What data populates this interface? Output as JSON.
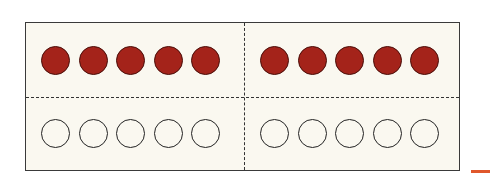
{
  "figure": {
    "frames": [
      {
        "top_row": [
          "filled",
          "filled",
          "filled",
          "filled",
          "filled"
        ],
        "bottom_row": [
          "empty",
          "empty",
          "empty",
          "empty",
          "empty"
        ]
      },
      {
        "top_row": [
          "filled",
          "filled",
          "filled",
          "filled",
          "filled"
        ],
        "bottom_row": [
          "empty",
          "empty",
          "empty",
          "empty",
          "empty"
        ]
      }
    ],
    "filled_count": 10,
    "empty_count": 10,
    "colors": {
      "filled": "#a4231a",
      "background": "#faf8f0",
      "border": "#3a3a3a",
      "accent": "#e0572b"
    }
  }
}
